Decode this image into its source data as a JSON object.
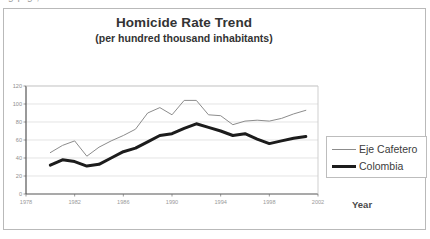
{
  "cutoff_text": "g                                                 p         g                      ,",
  "chart_data": {
    "type": "line",
    "title": "Homicide Rate Trend",
    "subtitle": "(per hundred thousand inhabitants)",
    "xlabel": "Year",
    "ylabel": "",
    "xlim": [
      1978,
      2002
    ],
    "ylim": [
      0,
      120
    ],
    "ytick_step": 20,
    "yticks": [
      0,
      20,
      40,
      60,
      80,
      100,
      120
    ],
    "xticks": [
      1978,
      1982,
      1986,
      1990,
      1994,
      1998,
      2002
    ],
    "grid": "horizontal",
    "legend_position": "right-outside",
    "x": [
      1980,
      1981,
      1982,
      1983,
      1984,
      1985,
      1986,
      1987,
      1988,
      1989,
      1990,
      1991,
      1992,
      1993,
      1994,
      1995,
      1996,
      1997,
      1998,
      1999,
      2000,
      2001
    ],
    "series": [
      {
        "name": "Eje Cafetero",
        "color": "#8c8c8c",
        "width": 1,
        "values": [
          46,
          54,
          59,
          42,
          52,
          59,
          65,
          72,
          90,
          96,
          88,
          104,
          104,
          88,
          87,
          77,
          81,
          82,
          81,
          84,
          89,
          93
        ]
      },
      {
        "name": "Colombia",
        "color": "#1c1c1c",
        "width": 3,
        "values": [
          32,
          38,
          36,
          31,
          33,
          40,
          47,
          51,
          58,
          65,
          67,
          73,
          78,
          74,
          70,
          65,
          67,
          61,
          56,
          59,
          62,
          64
        ]
      }
    ]
  },
  "legend": {
    "entries": [
      {
        "label": "Eje Cafetero",
        "swatch": "thin-gray-line"
      },
      {
        "label": "Colombia",
        "swatch": "thick-black-line"
      }
    ]
  },
  "colors": {
    "eje_cafetero": "#8c8c8c",
    "colombia": "#1c1c1c",
    "grid": "#d8d8d8",
    "axis": "#6e6e6e",
    "frame": "#b9b9b9"
  }
}
